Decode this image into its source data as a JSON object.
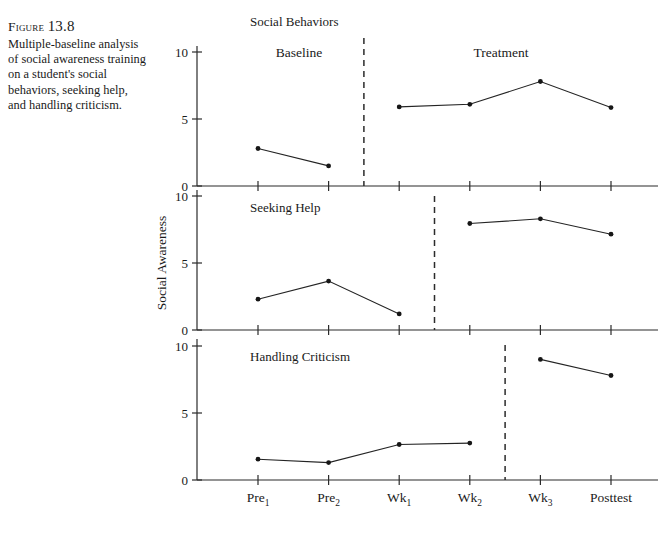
{
  "caption": {
    "figure_word": "Figure",
    "figure_number": "13.8",
    "body": "Multiple-baseline analysis of social awareness training on a student's social behaviors, seeking help, and handling criticism."
  },
  "axes": {
    "y_axis_title": "Social Awareness",
    "y_ticks": [
      "10",
      "5",
      "0"
    ],
    "y_tick_values": [
      10,
      5,
      0
    ],
    "x_tick_labels": [
      {
        "base": "Pre",
        "sub": "1"
      },
      {
        "base": "Pre",
        "sub": "2"
      },
      {
        "base": "Wk",
        "sub": "1"
      },
      {
        "base": "Wk",
        "sub": "2"
      },
      {
        "base": "Wk",
        "sub": "3"
      },
      {
        "base": "Posttest",
        "sub": ""
      }
    ]
  },
  "phase_labels": {
    "baseline": "Baseline",
    "treatment": "Treatment"
  },
  "colors": {
    "line": "#242424",
    "point": "#161616",
    "axis": "#2b2b2b",
    "text": "#1a1a1a",
    "background": "#ffffff"
  },
  "chart_data": {
    "type": "line",
    "title": "Social Behaviors",
    "subtitle": "",
    "xlabel": "",
    "ylabel": "Social Awareness",
    "ylim": [
      0,
      10
    ],
    "grid": false,
    "legend": "none",
    "x": [
      "Pre1",
      "Pre2",
      "Wk1",
      "Wk2",
      "Wk3",
      "Posttest"
    ],
    "annotations": [
      "Baseline",
      "Treatment"
    ],
    "panels": [
      {
        "name": "Social Behaviors",
        "title_is_group_heading": true,
        "phase_change_after": "Pre2",
        "phase_change_x": 1.5,
        "series": [
          {
            "name": "baseline",
            "x": [
              "Pre1",
              "Pre2"
            ],
            "values": [
              2.8,
              1.5
            ]
          },
          {
            "name": "treatment",
            "x": [
              "Wk1",
              "Wk2",
              "Wk3",
              "Posttest"
            ],
            "values": [
              5.9,
              6.1,
              7.8,
              5.85
            ]
          }
        ]
      },
      {
        "name": "Seeking Help",
        "title_is_group_heading": false,
        "phase_change_after": "Wk1",
        "phase_change_x": 2.5,
        "series": [
          {
            "name": "baseline",
            "x": [
              "Pre1",
              "Pre2",
              "Wk1"
            ],
            "values": [
              2.3,
              3.65,
              1.2
            ]
          },
          {
            "name": "treatment",
            "x": [
              "Wk2",
              "Wk3",
              "Posttest"
            ],
            "values": [
              7.95,
              8.3,
              7.15
            ]
          }
        ]
      },
      {
        "name": "Handling Criticism",
        "title_is_group_heading": false,
        "phase_change_after": "Wk2",
        "phase_change_x": 3.5,
        "series": [
          {
            "name": "baseline",
            "x": [
              "Pre1",
              "Pre2",
              "Wk1",
              "Wk2"
            ],
            "values": [
              1.55,
              1.3,
              2.65,
              2.75
            ]
          },
          {
            "name": "treatment",
            "x": [
              "Wk3",
              "Posttest"
            ],
            "values": [
              9.0,
              7.8
            ]
          }
        ]
      }
    ]
  }
}
